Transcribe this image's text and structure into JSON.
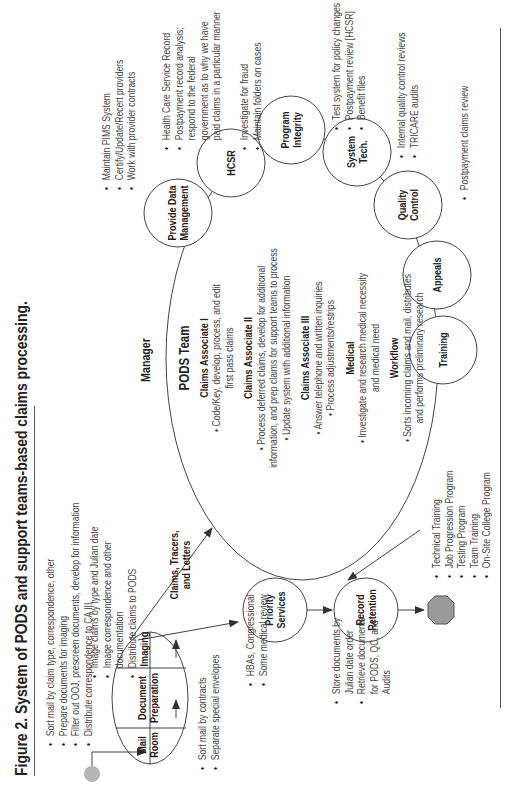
{
  "figure": {
    "title": "Figure 2. System of PODS and support teams-based claims processing."
  },
  "intake": {
    "nodes": [
      "Mail Room",
      "Document Preparation",
      "Imaging"
    ],
    "mail_room_label_1": "Mail",
    "mail_room_label_2": "Room",
    "doc_prep_label_1": "Document",
    "doc_prep_label_2": "Preparation",
    "imaging_label": "Imaging",
    "doc_prep_notes": [
      "Sort mail by claim type, correspondence, other",
      "Prepare documents for imaging",
      "Filter out OOJ, prescreen documents, develop for information",
      "Distribute correspondence to CA III"
    ],
    "mail_room_notes": [
      "Sort mail by contracts",
      "Separate special envelopes"
    ],
    "imaging_notes": [
      "Image claims by type and Julian date",
      "Image correspondence and other",
      "documentation",
      "Distribute claims to PODS"
    ]
  },
  "flow_label_1": "Claims, Tracers,",
  "flow_label_2": "and Letters",
  "priority_services": {
    "label_1": "Priority",
    "label_2": "Services",
    "notes": [
      "HBAs, Congressional",
      "Some medical review"
    ]
  },
  "record_retention": {
    "label_1": "Record",
    "label_2": "Retention",
    "notes": [
      "Store documents by",
      "Julian date order",
      "Retrieve documents",
      "for PODS, QC, and",
      "Audits"
    ]
  },
  "manager": {
    "label": "Manager"
  },
  "pods_team": {
    "title": "PODS Team",
    "sections": [
      {
        "heading": "Claims Associate I",
        "lines": [
          "• Code/Key, develop, process, and edit",
          "first pass claims"
        ]
      },
      {
        "heading": "Claims Associate II",
        "lines": [
          "• Process deferred claims, develop for additional",
          "information, and prep claims for support teams to process",
          "• Update system with additional information"
        ]
      },
      {
        "heading": "Claims Associate III",
        "lines": [
          "• Answer telephone and written inquiries",
          "• Process adjustments/restrips"
        ]
      },
      {
        "heading": "Medical",
        "lines": [
          "• Investigate and research medical necessity",
          "and medical need"
        ]
      },
      {
        "heading": "Workflow",
        "lines": [
          "• Sorts incoming claims and mail, distributes",
          "and performs preliminary research"
        ]
      }
    ]
  },
  "support_teams": [
    {
      "label_1": "Provide Data",
      "label_2": "Management",
      "notes": [
        "Maintain PIMS System",
        "Certify/Update/Recert providers",
        "Work with provider contracts"
      ]
    },
    {
      "label_1": "HCSR",
      "label_2": "",
      "notes": [
        "Health Care Service Record",
        "Postpayment record analysis;",
        "respond to the federal",
        "government as to why we have",
        "paid claims in a particular manner"
      ]
    },
    {
      "label_1": "Program",
      "label_2": "Integrity",
      "notes": [
        "Investigate for fraud",
        "Maintain folders on cases"
      ]
    },
    {
      "label_1": "System",
      "label_2": "Tech.",
      "notes": [
        "Test system for policy changes",
        "Postpayment review [HCSR]",
        "Benefit files"
      ]
    },
    {
      "label_1": "Quality",
      "label_2": "Control",
      "notes": [
        "Internal quality control reviews",
        "TRICARE audits"
      ]
    },
    {
      "label_1": "Appeals",
      "label_2": "",
      "notes": [
        "Postpayment claims review"
      ]
    },
    {
      "label_1": "Training",
      "label_2": "",
      "notes": [
        "Technical Training",
        "Job Progression Program",
        "Testing Program",
        "Team Training",
        "On-Site College Program"
      ]
    }
  ],
  "colors": {
    "line": "#444444",
    "start_dot": "#b5b5b5",
    "end_octagon": "#9a9a9a"
  }
}
